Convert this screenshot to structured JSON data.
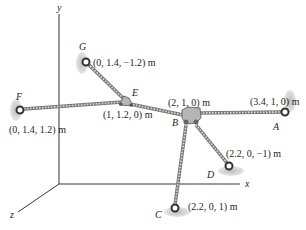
{
  "figure": {
    "axes": {
      "x": "x",
      "y": "y",
      "z": "z"
    },
    "points": {
      "A": {
        "label": "A",
        "coords": "(3.4, 1, 0) m"
      },
      "B": {
        "label": "B",
        "coords": "(2, 1, 0) m"
      },
      "C": {
        "label": "C",
        "coords": "(2.2, 0, 1) m"
      },
      "D": {
        "label": "D",
        "coords": "(2.2, 0, −1) m"
      },
      "E": {
        "label": "E",
        "coords": "(1, 1.2, 0) m"
      },
      "F": {
        "label": "F",
        "coords": "(0, 1.4, 1.2) m"
      },
      "G": {
        "label": "G",
        "coords": "(0, 1.4, −1.2) m"
      }
    },
    "colors": {
      "line": "#231f20",
      "cable": "#8a8a8a",
      "ring": "#3a3a3a",
      "support_shadow": "#c8c8c8",
      "plate": "#b0b0b0"
    }
  }
}
